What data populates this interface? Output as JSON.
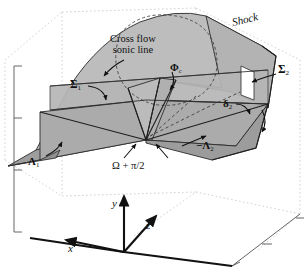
{
  "figure": {
    "title_label": "Shock",
    "background_color": "#ffffff",
    "surface_upper_color": "#b9b9b9",
    "surface_lower_color": "#a8a8a8",
    "surface_dark_color": "#9a9a9a",
    "line_color": "#1a1a1a",
    "construction_color": "#cfcfcf"
  },
  "annotations": {
    "shock": "Shock",
    "cross_flow_line1": "Cross flow",
    "cross_flow_line2": "sonic line",
    "sigma_1": "Σ",
    "sigma_1_sub": "1",
    "sigma_2": "Σ",
    "sigma_2_sub": "2",
    "phi_c": "Φ",
    "phi_c_sub": "c",
    "delta_2": "δ",
    "delta_2_sub": "2",
    "lambda_1": "Λ",
    "lambda_1_sub": "1",
    "lambda_2": "−Λ",
    "lambda_2_sub": "2",
    "omega": "Ω + π/2"
  },
  "axes": {
    "x_label": "x",
    "y_label": "y",
    "z_label": "z"
  }
}
